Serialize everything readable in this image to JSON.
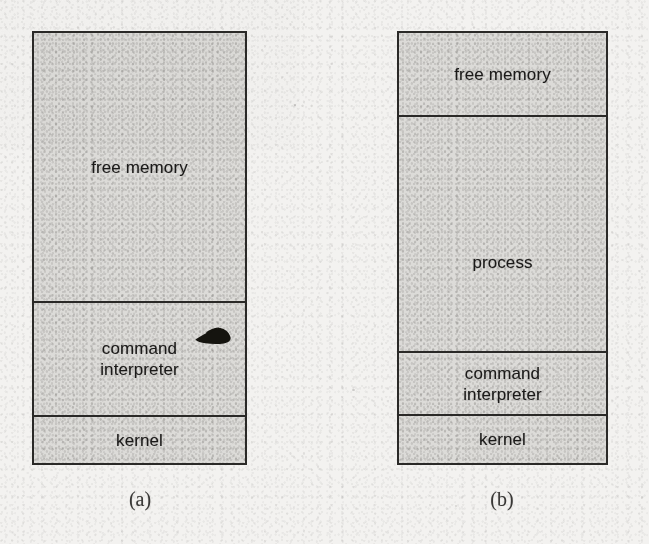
{
  "page": {
    "background_color": "#f3f2f0",
    "box_fill_color": "#dcdbd8",
    "box_border_color": "#2a2927",
    "text_color": "#1b1a19"
  },
  "figures": [
    {
      "id": "a",
      "caption": "(a)",
      "regions": [
        {
          "name": "free-memory",
          "label": "free memory"
        },
        {
          "name": "command-interpreter",
          "label": "command\ninterpreter"
        },
        {
          "name": "kernel",
          "label": "kernel"
        }
      ]
    },
    {
      "id": "b",
      "caption": "(b)",
      "regions": [
        {
          "name": "free-memory",
          "label": "free memory"
        },
        {
          "name": "process",
          "label": "process"
        },
        {
          "name": "command-interpreter",
          "label": "command\ninterpreter"
        },
        {
          "name": "kernel",
          "label": "kernel"
        }
      ]
    }
  ],
  "artifacts": {
    "ink_smudge_label": "ink-smudge"
  }
}
